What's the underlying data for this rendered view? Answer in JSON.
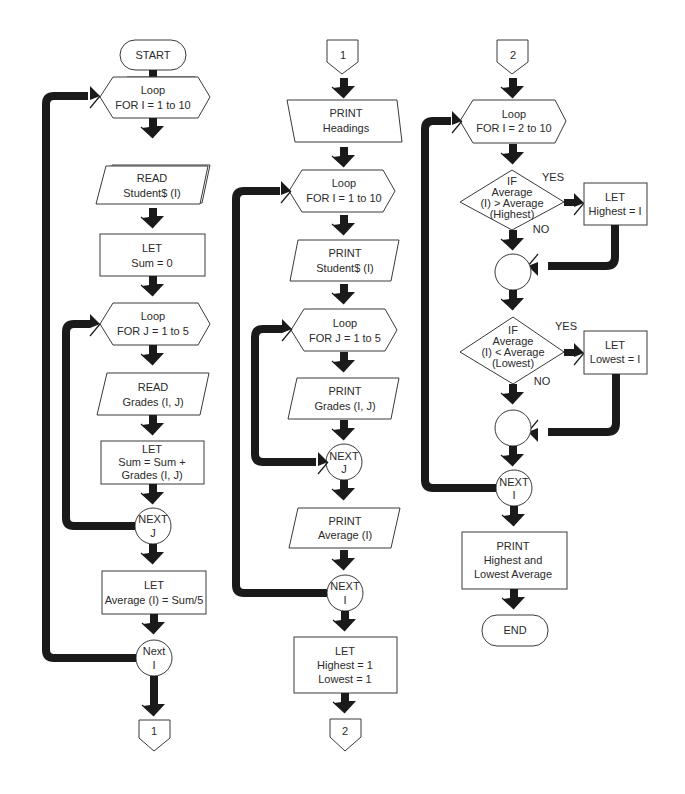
{
  "diagram": {
    "type": "flowchart",
    "columns": [
      {
        "id": "col1",
        "nodes": [
          {
            "id": "start",
            "shape": "terminal",
            "lines": [
              "START"
            ]
          },
          {
            "id": "loop-i-1",
            "shape": "hexagon",
            "lines": [
              "Loop",
              "FOR I = 1 to 10"
            ]
          },
          {
            "id": "read-student",
            "shape": "parallelogram",
            "lines": [
              "READ",
              "Student$ (I)"
            ]
          },
          {
            "id": "let-sum-0",
            "shape": "rectangle",
            "lines": [
              "LET",
              "Sum = 0"
            ]
          },
          {
            "id": "loop-j-1",
            "shape": "hexagon",
            "lines": [
              "Loop",
              "FOR J = 1 to 5"
            ]
          },
          {
            "id": "read-grades",
            "shape": "parallelogram",
            "lines": [
              "READ",
              "Grades (I, J)"
            ]
          },
          {
            "id": "let-sum-add",
            "shape": "rectangle",
            "lines": [
              "LET",
              "Sum = Sum +",
              "Grades (I, J)"
            ]
          },
          {
            "id": "next-j-1",
            "shape": "circle",
            "lines": [
              "NEXT",
              "J"
            ]
          },
          {
            "id": "let-average",
            "shape": "rectangle",
            "lines": [
              "LET",
              "Average (I) = Sum/5"
            ]
          },
          {
            "id": "next-i-1",
            "shape": "circle",
            "lines": [
              "Next",
              "I"
            ]
          },
          {
            "id": "connector-out-1",
            "shape": "offpage",
            "lines": [
              "1"
            ]
          }
        ]
      },
      {
        "id": "col2",
        "nodes": [
          {
            "id": "connector-in-1",
            "shape": "offpage",
            "lines": [
              "1"
            ]
          },
          {
            "id": "print-headings",
            "shape": "parallelogram",
            "lines": [
              "PRINT",
              "Headings"
            ]
          },
          {
            "id": "loop-i-2",
            "shape": "hexagon",
            "lines": [
              "Loop",
              "FOR I = 1 to 10"
            ]
          },
          {
            "id": "print-student",
            "shape": "parallelogram",
            "lines": [
              "PRINT",
              "Student$  (I)"
            ]
          },
          {
            "id": "loop-j-2",
            "shape": "hexagon",
            "lines": [
              "Loop",
              "FOR J = 1 to 5"
            ]
          },
          {
            "id": "print-grades",
            "shape": "parallelogram",
            "lines": [
              "PRINT",
              "Grades (I, J)"
            ]
          },
          {
            "id": "next-j-2",
            "shape": "circle",
            "lines": [
              "NEXT",
              "J"
            ]
          },
          {
            "id": "print-average",
            "shape": "parallelogram",
            "lines": [
              "PRINT",
              "Average (I)"
            ]
          },
          {
            "id": "next-i-2",
            "shape": "circle",
            "lines": [
              "NEXT",
              "I"
            ]
          },
          {
            "id": "let-highest-lowest",
            "shape": "rectangle",
            "lines": [
              "LET",
              "Highest = 1",
              "Lowest = 1"
            ]
          },
          {
            "id": "connector-out-2",
            "shape": "offpage",
            "lines": [
              "2"
            ]
          }
        ]
      },
      {
        "id": "col3",
        "nodes": [
          {
            "id": "connector-in-2",
            "shape": "offpage",
            "lines": [
              "2"
            ]
          },
          {
            "id": "loop-i-3",
            "shape": "hexagon",
            "lines": [
              "Loop",
              "FOR I = 2 to 10"
            ]
          },
          {
            "id": "if-highest",
            "shape": "diamond",
            "lines": [
              "IF",
              "Average",
              "(I)  >  Average",
              "(Highest)"
            ],
            "yes_label": "YES",
            "no_label": "NO"
          },
          {
            "id": "let-highest-i",
            "shape": "rectangle",
            "lines": [
              "LET",
              "Highest = I"
            ]
          },
          {
            "id": "join-1",
            "shape": "circle",
            "lines": []
          },
          {
            "id": "if-lowest",
            "shape": "diamond",
            "lines": [
              "IF",
              "Average",
              "(I) < Average",
              "(Lowest)"
            ],
            "yes_label": "YES",
            "no_label": "NO"
          },
          {
            "id": "let-lowest-i",
            "shape": "rectangle",
            "lines": [
              "LET",
              "Lowest = I"
            ]
          },
          {
            "id": "join-2",
            "shape": "circle",
            "lines": []
          },
          {
            "id": "next-i-3",
            "shape": "circle",
            "lines": [
              "NEXT",
              "I"
            ]
          },
          {
            "id": "print-high-low",
            "shape": "rectangle",
            "lines": [
              "PRINT",
              "Highest and",
              "Lowest Average"
            ]
          },
          {
            "id": "end",
            "shape": "terminal",
            "lines": [
              "END"
            ]
          }
        ]
      }
    ],
    "colors": {
      "stroke": "#3a3a3a",
      "flow": "#1a1a1a",
      "background": "#ffffff",
      "text": "#2a2a2a"
    }
  }
}
